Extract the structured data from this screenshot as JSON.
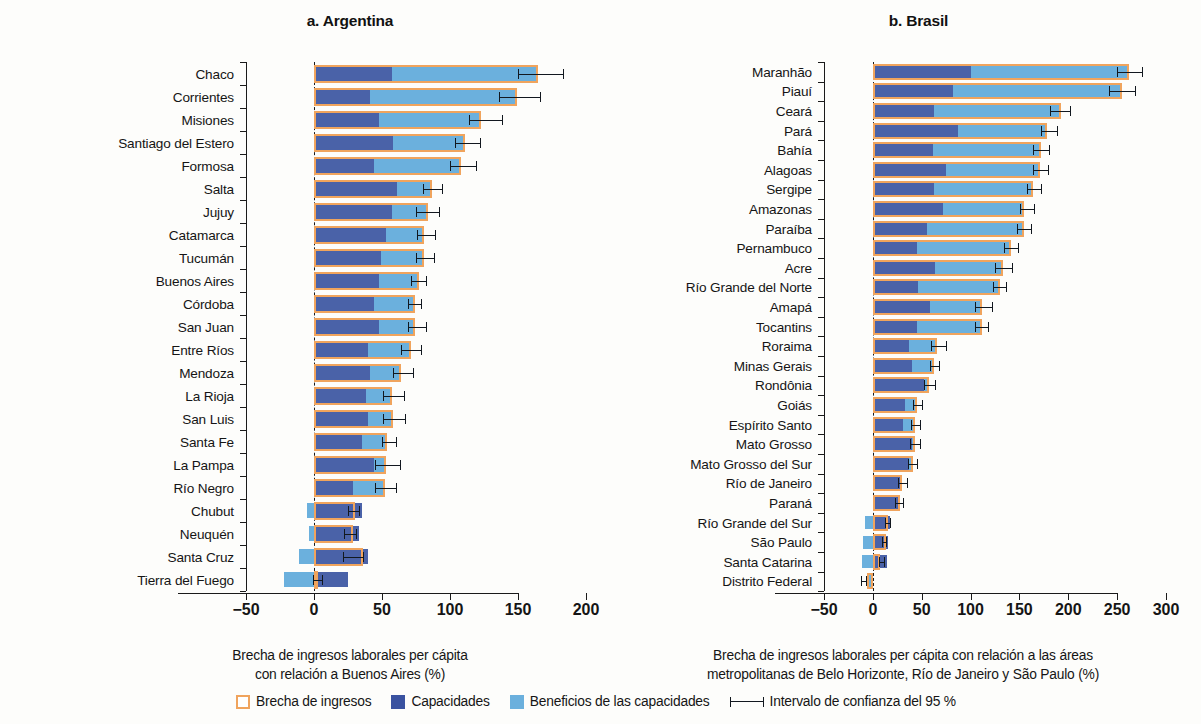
{
  "figure": {
    "legend": {
      "gap_label": "Brecha de ingresos",
      "capacities_label": "Capacidades",
      "benefits_label": "Beneficios de las capacidades",
      "ci_label": "Intervalo de confianza del 95 %"
    },
    "colors": {
      "gap_outline": "#f0a45d",
      "capacities": "#4a62a8",
      "benefits": "#6bb0dd",
      "error_bar": "#12181f"
    }
  },
  "chart_data": [
    {
      "id": "panel_a",
      "type": "bar",
      "orientation": "horizontal",
      "title": "a. Argentina",
      "xlabel": "Brecha de ingresos laborales per cápita con relación a Buenos Aires (%)",
      "xlabel_lines": [
        "Brecha de ingresos laborales per cápita",
        "con relación a Buenos Aires (%)"
      ],
      "ylabel": "",
      "xlim": [
        -50,
        200
      ],
      "xticks": [
        -50,
        0,
        50,
        100,
        150,
        200
      ],
      "xticklabels": [
        "−50",
        "0",
        "50",
        "100",
        "150",
        "200"
      ],
      "grid": false,
      "zero_line": true,
      "legend_position": "bottom-center",
      "series": [
        {
          "name": "Capacidades",
          "key": "capacities"
        },
        {
          "name": "Beneficios de las capacidades",
          "key": "benefits"
        },
        {
          "name": "Brecha de ingresos",
          "key": "gap"
        }
      ],
      "categories": [
        "Chaco",
        "Corrientes",
        "Misiones",
        "Santiago del Estero",
        "Formosa",
        "Salta",
        "Jujuy",
        "Catamarca",
        "Tucumán",
        "Buenos Aires",
        "Córdoba",
        "San Juan",
        "Entre Ríos",
        "Mendoza",
        "La Rioja",
        "San Luis",
        "Santa Fe",
        "La Pampa",
        "Río Negro",
        "Chubut",
        "Neuquén",
        "Santa Cruz",
        "Tierra del Fuego"
      ],
      "rows": [
        {
          "category": "Chaco",
          "gap": 165,
          "capacities": 57,
          "benefits": 108,
          "ci_low": 150,
          "ci_high": 183
        },
        {
          "category": "Corrientes",
          "gap": 149,
          "capacities": 41,
          "benefits": 108,
          "ci_low": 136,
          "ci_high": 166
        },
        {
          "category": "Misiones",
          "gap": 123,
          "capacities": 48,
          "benefits": 75,
          "ci_low": 114,
          "ci_high": 138
        },
        {
          "category": "Santiago del Estero",
          "gap": 111,
          "capacities": 58,
          "benefits": 53,
          "ci_low": 104,
          "ci_high": 122
        },
        {
          "category": "Formosa",
          "gap": 108,
          "capacities": 44,
          "benefits": 64,
          "ci_low": 100,
          "ci_high": 119
        },
        {
          "category": "Salta",
          "gap": 87,
          "capacities": 61,
          "benefits": 26,
          "ci_low": 80,
          "ci_high": 94
        },
        {
          "category": "Jujuy",
          "gap": 84,
          "capacities": 57,
          "benefits": 27,
          "ci_low": 75,
          "ci_high": 92
        },
        {
          "category": "Catamarca",
          "gap": 81,
          "capacities": 53,
          "benefits": 28,
          "ci_low": 76,
          "ci_high": 89
        },
        {
          "category": "Tucumán",
          "gap": 81,
          "capacities": 49,
          "benefits": 32,
          "ci_low": 75,
          "ci_high": 88
        },
        {
          "category": "Buenos Aires",
          "gap": 77,
          "capacities": 48,
          "benefits": 29,
          "ci_low": 71,
          "ci_high": 82
        },
        {
          "category": "Córdoba",
          "gap": 74,
          "capacities": 44,
          "benefits": 30,
          "ci_low": 69,
          "ci_high": 79
        },
        {
          "category": "San Juan",
          "gap": 74,
          "capacities": 48,
          "benefits": 26,
          "ci_low": 69,
          "ci_high": 82
        },
        {
          "category": "Entre Ríos",
          "gap": 71,
          "capacities": 40,
          "benefits": 31,
          "ci_low": 64,
          "ci_high": 79
        },
        {
          "category": "Mendoza",
          "gap": 64,
          "capacities": 41,
          "benefits": 23,
          "ci_low": 58,
          "ci_high": 73
        },
        {
          "category": "La Rioja",
          "gap": 57,
          "capacities": 38,
          "benefits": 19,
          "ci_low": 51,
          "ci_high": 66
        },
        {
          "category": "San Luis",
          "gap": 58,
          "capacities": 40,
          "benefits": 18,
          "ci_low": 51,
          "ci_high": 67
        },
        {
          "category": "Santa Fe",
          "gap": 54,
          "capacities": 35,
          "benefits": 19,
          "ci_low": 50,
          "ci_high": 60
        },
        {
          "category": "La Pampa",
          "gap": 53,
          "capacities": 44,
          "benefits": 9,
          "ci_low": 45,
          "ci_high": 63
        },
        {
          "category": "Río Negro",
          "gap": 52,
          "capacities": 29,
          "benefits": 23,
          "ci_low": 45,
          "ci_high": 60
        },
        {
          "category": "Chubut",
          "gap": 30,
          "capacities": 35,
          "benefits": -5,
          "ci_low": 25,
          "ci_high": 33
        },
        {
          "category": "Neuquén",
          "gap": 29,
          "capacities": 33,
          "benefits": -4,
          "ci_low": 22,
          "ci_high": 31
        },
        {
          "category": "Santa Cruz",
          "gap": 36,
          "capacities": 40,
          "benefits": -11,
          "ci_low": 21,
          "ci_high": 36
        },
        {
          "category": "Tierra del Fuego",
          "gap": 1,
          "capacities": 25,
          "benefits": -22,
          "ci_low": -1,
          "ci_high": 6
        }
      ]
    },
    {
      "id": "panel_b",
      "type": "bar",
      "orientation": "horizontal",
      "title": "b. Brasil",
      "xlabel": "Brecha de ingresos laborales per cápita con relación a las áreas metropolitanas de Belo Horizonte, Río de Janeiro y São Paulo (%)",
      "xlabel_lines": [
        "Brecha de ingresos laborales per cápita con relación a las áreas",
        "metropolitanas de Belo Horizonte, Río de Janeiro y São Paulo (%)"
      ],
      "ylabel": "",
      "xlim": [
        -50,
        300
      ],
      "xticks": [
        -50,
        0,
        50,
        100,
        150,
        200,
        250,
        300
      ],
      "xticklabels": [
        "−50",
        "0",
        "50",
        "100",
        "150",
        "200",
        "250",
        "300"
      ],
      "grid": false,
      "zero_line": true,
      "legend_position": "bottom-center",
      "series": [
        {
          "name": "Capacidades",
          "key": "capacities"
        },
        {
          "name": "Beneficios de las capacidades",
          "key": "benefits"
        },
        {
          "name": "Brecha de ingresos",
          "key": "gap"
        }
      ],
      "categories": [
        "Maranhão",
        "Piauí",
        "Ceará",
        "Pará",
        "Bahía",
        "Alagoas",
        "Sergipe",
        "Amazonas",
        "Paraíba",
        "Pernambuco",
        "Acre",
        "Río Grande del Norte",
        "Amapá",
        "Tocantins",
        "Roraima",
        "Minas Gerais",
        "Rondônia",
        "Goiás",
        "Espírito Santo",
        "Mato Grosso",
        "Mato Grosso del Sur",
        "Río de Janeiro",
        "Paraná",
        "Río Grande del Sur",
        "São Paulo",
        "Santa Catarina",
        "Distrito Federal"
      ],
      "rows": [
        {
          "category": "Maranhão",
          "gap": 262,
          "capacities": 100,
          "benefits": 162,
          "ci_low": 250,
          "ci_high": 275
        },
        {
          "category": "Piauí",
          "gap": 255,
          "capacities": 82,
          "benefits": 173,
          "ci_low": 242,
          "ci_high": 268
        },
        {
          "category": "Ceará",
          "gap": 193,
          "capacities": 63,
          "benefits": 130,
          "ci_low": 181,
          "ci_high": 202
        },
        {
          "category": "Pará",
          "gap": 178,
          "capacities": 87,
          "benefits": 91,
          "ci_low": 172,
          "ci_high": 188
        },
        {
          "category": "Bahía",
          "gap": 172,
          "capacities": 62,
          "benefits": 110,
          "ci_low": 164,
          "ci_high": 180
        },
        {
          "category": "Alagoas",
          "gap": 171,
          "capacities": 75,
          "benefits": 96,
          "ci_low": 164,
          "ci_high": 179
        },
        {
          "category": "Sergipe",
          "gap": 164,
          "capacities": 63,
          "benefits": 101,
          "ci_low": 158,
          "ci_high": 172
        },
        {
          "category": "Amazonas",
          "gap": 155,
          "capacities": 72,
          "benefits": 83,
          "ci_low": 151,
          "ci_high": 165
        },
        {
          "category": "Paraíba",
          "gap": 155,
          "capacities": 55,
          "benefits": 100,
          "ci_low": 148,
          "ci_high": 162
        },
        {
          "category": "Pernambuco",
          "gap": 141,
          "capacities": 45,
          "benefits": 96,
          "ci_low": 134,
          "ci_high": 149
        },
        {
          "category": "Acre",
          "gap": 133,
          "capacities": 64,
          "benefits": 69,
          "ci_low": 125,
          "ci_high": 142
        },
        {
          "category": "Río Grande del Norte",
          "gap": 130,
          "capacities": 46,
          "benefits": 84,
          "ci_low": 123,
          "ci_high": 136
        },
        {
          "category": "Amapá",
          "gap": 112,
          "capacities": 58,
          "benefits": 54,
          "ci_low": 105,
          "ci_high": 122
        },
        {
          "category": "Tocantins",
          "gap": 112,
          "capacities": 45,
          "benefits": 67,
          "ci_low": 105,
          "ci_high": 118
        },
        {
          "category": "Roraima",
          "gap": 66,
          "capacities": 37,
          "benefits": 29,
          "ci_low": 60,
          "ci_high": 75
        },
        {
          "category": "Minas Gerais",
          "gap": 63,
          "capacities": 40,
          "benefits": 23,
          "ci_low": 58,
          "ci_high": 68
        },
        {
          "category": "Rondônia",
          "gap": 57,
          "capacities": 52,
          "benefits": 5,
          "ci_low": 52,
          "ci_high": 64
        },
        {
          "category": "Goiás",
          "gap": 45,
          "capacities": 33,
          "benefits": 12,
          "ci_low": 41,
          "ci_high": 50
        },
        {
          "category": "Espírito Santo",
          "gap": 43,
          "capacities": 31,
          "benefits": 12,
          "ci_low": 39,
          "ci_high": 48
        },
        {
          "category": "Mato Grosso",
          "gap": 43,
          "capacities": 40,
          "benefits": 3,
          "ci_low": 38,
          "ci_high": 48
        },
        {
          "category": "Mato Grosso del Sur",
          "gap": 41,
          "capacities": 37,
          "benefits": 4,
          "ci_low": 36,
          "ci_high": 45
        },
        {
          "category": "Río de Janeiro",
          "gap": 30,
          "capacities": 29,
          "benefits": 1,
          "ci_low": 26,
          "ci_high": 35
        },
        {
          "category": "Paraná",
          "gap": 28,
          "capacities": 26,
          "benefits": 2,
          "ci_low": 23,
          "ci_high": 31
        },
        {
          "category": "Río Grande del Sur",
          "gap": 15,
          "capacities": 18,
          "benefits": -8,
          "ci_low": 12,
          "ci_high": 18
        },
        {
          "category": "São Paulo",
          "gap": 13,
          "capacities": 16,
          "benefits": -10,
          "ci_low": 9,
          "ci_high": 13
        },
        {
          "category": "Santa Catarina",
          "gap": 7,
          "capacities": 14,
          "benefits": -11,
          "ci_low": 6,
          "ci_high": 11
        },
        {
          "category": "Distrito Federal",
          "gap": -6,
          "capacities": -2,
          "benefits": -4,
          "ci_low": -12,
          "ci_high": -7
        }
      ]
    }
  ]
}
